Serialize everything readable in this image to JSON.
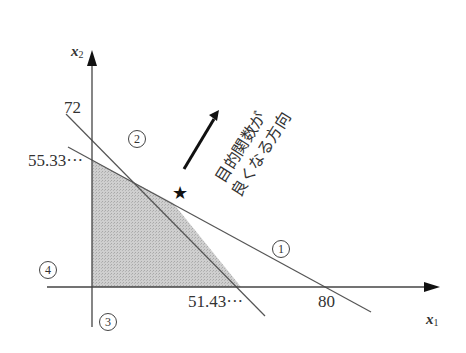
{
  "axes": {
    "x_label": "x",
    "x_sub": "1",
    "y_label": "x",
    "y_sub": "2"
  },
  "ticks": {
    "y_72": "72",
    "y_55": "55.33···",
    "x_51": "51.43···",
    "x_80": "80"
  },
  "constraints": [
    {
      "id": "1",
      "label": "①",
      "x_intercept": 80,
      "y_intercept": 55.33
    },
    {
      "id": "2",
      "label": "②",
      "x_intercept": 51.43,
      "y_intercept": 72
    },
    {
      "id": "3",
      "label": "③",
      "desc": "x1 >= 0"
    },
    {
      "id": "4",
      "label": "④",
      "desc": "x2 >= 0"
    }
  ],
  "annotation": {
    "line1": "目的関数が",
    "line2": "良くなる方向"
  },
  "optimum_marker": "★",
  "colors": {
    "feasible_fill": "#c8c8c8",
    "line": "#555555",
    "axis": "#444444",
    "arrow": "#111111"
  }
}
